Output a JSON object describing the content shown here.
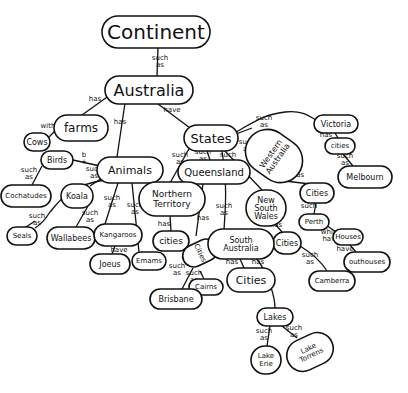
{
  "diagram": {
    "type": "concept-map",
    "style": "hand-drawn",
    "colors": {
      "ink": "#111111",
      "background": "#ffffff"
    },
    "nodes": [
      {
        "id": "continent",
        "label": "Continent",
        "x": 156,
        "y": 32,
        "rx": 54,
        "ry": 16,
        "fs": 20
      },
      {
        "id": "australia",
        "label": "Australia",
        "x": 149,
        "y": 90,
        "rx": 44,
        "ry": 14,
        "fs": 16
      },
      {
        "id": "farms",
        "label": "farms",
        "x": 81,
        "y": 128,
        "rx": 27,
        "ry": 13,
        "fs": 12
      },
      {
        "id": "cows",
        "label": "Cows",
        "x": 37,
        "y": 142,
        "rx": 13,
        "ry": 9,
        "fs": 8
      },
      {
        "id": "birds",
        "label": "Birds",
        "x": 57,
        "y": 160,
        "rx": 16,
        "ry": 9,
        "fs": 8
      },
      {
        "id": "animals",
        "label": "Animals",
        "x": 130,
        "y": 170,
        "rx": 33,
        "ry": 13,
        "fs": 11
      },
      {
        "id": "cockatoos",
        "label": "Cochatudes",
        "x": 26,
        "y": 196,
        "rx": 25,
        "ry": 11,
        "fs": 7
      },
      {
        "id": "koala",
        "label": "Koala",
        "x": 77,
        "y": 196,
        "rx": 16,
        "ry": 12,
        "fs": 8
      },
      {
        "id": "seals",
        "label": "Seals",
        "x": 22,
        "y": 236,
        "rx": 15,
        "ry": 9,
        "fs": 7
      },
      {
        "id": "wallabees",
        "label": "Wallabees",
        "x": 71,
        "y": 238,
        "rx": 24,
        "ry": 11,
        "fs": 8
      },
      {
        "id": "kangaroos",
        "label": "Kangaroos",
        "x": 118,
        "y": 235,
        "rx": 24,
        "ry": 11,
        "fs": 7
      },
      {
        "id": "joeys",
        "label": "Joeus",
        "x": 110,
        "y": 264,
        "rx": 20,
        "ry": 10,
        "fs": 8
      },
      {
        "id": "emus",
        "label": "Emams",
        "x": 149,
        "y": 261,
        "rx": 17,
        "ry": 9,
        "fs": 7
      },
      {
        "id": "states",
        "label": "States",
        "x": 211,
        "y": 138,
        "rx": 27,
        "ry": 13,
        "fs": 13
      },
      {
        "id": "queensland",
        "label": "Queensland",
        "x": 214,
        "y": 172,
        "rx": 36,
        "ry": 12,
        "fs": 10
      },
      {
        "id": "northern-territory",
        "label": "Northern\nTerritory",
        "x": 172,
        "y": 199,
        "rx": 33,
        "ry": 17,
        "fs": 9
      },
      {
        "id": "nt-cities",
        "label": "cities",
        "x": 171,
        "y": 241,
        "rx": 18,
        "ry": 10,
        "fs": 9
      },
      {
        "id": "new-south-wales",
        "label": "New\nSouth\nWales",
        "x": 266,
        "y": 208,
        "rx": 20,
        "ry": 18,
        "fs": 8
      },
      {
        "id": "western-australia",
        "label": "Western\nAustralia",
        "x": 274,
        "y": 156,
        "rx": 22,
        "ry": 30,
        "fs": 8,
        "rotate": -55
      },
      {
        "id": "victoria",
        "label": "Victoria",
        "x": 336,
        "y": 124,
        "rx": 22,
        "ry": 9,
        "fs": 8
      },
      {
        "id": "vic-cities",
        "label": "cities",
        "x": 340,
        "y": 146,
        "rx": 15,
        "ry": 8,
        "fs": 7
      },
      {
        "id": "melbourne",
        "label": "Melbourn",
        "x": 365,
        "y": 177,
        "rx": 27,
        "ry": 11,
        "fs": 8
      },
      {
        "id": "wa-cities",
        "label": "Cities",
        "x": 317,
        "y": 193,
        "rx": 17,
        "ry": 10,
        "fs": 8
      },
      {
        "id": "perth",
        "label": "Perth",
        "x": 314,
        "y": 222,
        "rx": 15,
        "ry": 8,
        "fs": 7
      },
      {
        "id": "houses",
        "label": "Houses",
        "x": 348,
        "y": 237,
        "rx": 15,
        "ry": 8,
        "fs": 7
      },
      {
        "id": "outhouses",
        "label": "outhouses",
        "x": 367,
        "y": 262,
        "rx": 23,
        "ry": 10,
        "fs": 7
      },
      {
        "id": "nsw-cities",
        "label": "Cities",
        "x": 287,
        "y": 243,
        "rx": 14,
        "ry": 11,
        "fs": 8
      },
      {
        "id": "canberra",
        "label": "Camberra",
        "x": 332,
        "y": 281,
        "rx": 23,
        "ry": 10,
        "fs": 7
      },
      {
        "id": "qld-cities",
        "label": "Cities",
        "x": 200,
        "y": 253,
        "rx": 11,
        "ry": 18,
        "fs": 7,
        "rotate": 65
      },
      {
        "id": "south-australia",
        "label": "South\nAustralia",
        "x": 241,
        "y": 244,
        "rx": 33,
        "ry": 15,
        "fs": 8
      },
      {
        "id": "sa-cities",
        "label": "Cities",
        "x": 251,
        "y": 280,
        "rx": 24,
        "ry": 12,
        "fs": 11
      },
      {
        "id": "cairns",
        "label": "Cairns",
        "x": 206,
        "y": 287,
        "rx": 17,
        "ry": 8,
        "fs": 7
      },
      {
        "id": "brisbane",
        "label": "Brisbane",
        "x": 176,
        "y": 299,
        "rx": 26,
        "ry": 10,
        "fs": 8
      },
      {
        "id": "lakes",
        "label": "Lakes",
        "x": 275,
        "y": 317,
        "rx": 18,
        "ry": 9,
        "fs": 8
      },
      {
        "id": "lake-erie",
        "label": "Lake\nErie",
        "x": 266,
        "y": 360,
        "rx": 15,
        "ry": 14,
        "fs": 7
      },
      {
        "id": "lake-torrens",
        "label": "Lake\nTorrens",
        "x": 310,
        "y": 352,
        "rx": 24,
        "ry": 16,
        "fs": 7,
        "rotate": -25
      }
    ],
    "edges": [
      {
        "from": "continent",
        "to": "australia",
        "label": "such as",
        "path": "M158,48 L157,76",
        "lx": 160,
        "ly": 60
      },
      {
        "from": "australia",
        "to": "farms",
        "label": "has",
        "path": "M110,95 L82,115",
        "lx": 95,
        "ly": 101
      },
      {
        "from": "australia",
        "to": "animals",
        "label": "has",
        "path": "M125,103 L117,157",
        "lx": 120,
        "ly": 124
      },
      {
        "from": "australia",
        "to": "states",
        "label": "have",
        "path": "M158,104 L190,128",
        "lx": 172,
        "ly": 112
      },
      {
        "from": "farms",
        "to": "cows",
        "label": "with",
        "path": "M56,130 L49,137",
        "lx": 48,
        "ly": 128
      },
      {
        "from": "animals",
        "to": "birds",
        "label": "b +",
        "path": "M100,166 L73,160",
        "lx": 84,
        "ly": 157
      },
      {
        "from": "animals",
        "to": "koala",
        "label": "such as",
        "path": "M102,178 L90,186",
        "lx": 94,
        "ly": 171
      },
      {
        "from": "animals",
        "to": "cockatoos",
        "label": "",
        "path": "M105,180 C70,185 60,200 50,212 C45,220 40,225 35,228",
        "lx": 0,
        "ly": 0
      },
      {
        "from": "birds",
        "to": "cockatoos",
        "label": "such as",
        "path": "M42,166 L32,185",
        "lx": 29,
        "ly": 172
      },
      {
        "from": "cockatoos",
        "to": "seals",
        "label": "such as",
        "path": "M35,221 L26,227",
        "lx": 37,
        "ly": 218
      },
      {
        "from": "animals",
        "to": "kangaroos",
        "label": "such as",
        "path": "M118,183 L105,224",
        "lx": 112,
        "ly": 200
      },
      {
        "from": "animals",
        "to": "wallabees",
        "label": "such as",
        "path": "M88,206 L76,227",
        "lx": 90,
        "ly": 215
      },
      {
        "from": "animals",
        "to": "emus",
        "label": "such as",
        "path": "M132,183 L139,252",
        "lx": 135,
        "ly": 207
      },
      {
        "from": "kangaroos",
        "to": "joeys",
        "label": "have",
        "path": "M115,246 L112,254",
        "lx": 119,
        "ly": 252
      },
      {
        "from": "states",
        "to": "northern-territory",
        "label": "such as",
        "path": "M190,147 L170,183",
        "lx": 180,
        "ly": 157
      },
      {
        "from": "states",
        "to": "queensland",
        "label": "such as",
        "path": "M207,151 L210,160",
        "lx": 203,
        "ly": 154
      },
      {
        "from": "states",
        "to": "new-south-wales",
        "label": "such as",
        "path": "M224,150 L262,190",
        "lx": 228,
        "ly": 157
      },
      {
        "from": "states",
        "to": "western-australia",
        "label": "such as",
        "path": "M236,134 L252,128",
        "lx": 247,
        "ly": 144
      },
      {
        "from": "states",
        "to": "victoria",
        "label": "such as",
        "path": "M236,132 C250,125 260,115 285,112 C300,110 308,115 316,120",
        "lx": 264,
        "ly": 120
      },
      {
        "from": "northern-territory",
        "to": "nt-cities",
        "label": "has",
        "path": "M170,216 L171,231",
        "lx": 164,
        "ly": 226
      },
      {
        "from": "queensland",
        "to": "qld-cities",
        "label": "has",
        "path": "M203,184 L196,236",
        "lx": 203,
        "ly": 220
      },
      {
        "from": "states",
        "to": "south-australia",
        "label": "such as",
        "path": "M222,151 C228,190 225,210 224,230",
        "lx": 224,
        "ly": 208
      },
      {
        "from": "western-australia",
        "to": "wa-cities",
        "label": "has",
        "path": "M285,181 L310,184",
        "lx": 298,
        "ly": 177
      },
      {
        "from": "victoria",
        "to": "vic-cities",
        "label": "has",
        "path": "M335,133 L338,138",
        "lx": 326,
        "ly": 137
      },
      {
        "from": "vic-cities",
        "to": "melbourne",
        "label": "such as",
        "path": "M343,154 L353,166",
        "lx": 345,
        "ly": 158
      },
      {
        "from": "wa-cities",
        "to": "perth",
        "label": "such",
        "path": "M316,203 L314,214",
        "lx": 309,
        "ly": 208
      },
      {
        "from": "perth",
        "to": "houses",
        "label": "which have",
        "path": "M326,225 L336,232",
        "lx": 331,
        "ly": 234
      },
      {
        "from": "houses",
        "to": "outhouses",
        "label": "have",
        "path": "M350,245 L356,252",
        "lx": 345,
        "ly": 251
      },
      {
        "from": "new-south-wales",
        "to": "nsw-cities",
        "label": "has",
        "path": "M276,225 L282,232",
        "lx": 276,
        "ly": 227
      },
      {
        "from": "nsw-cities",
        "to": "canberra",
        "label": "such as",
        "path": "M300,246 C315,255 322,263 327,271",
        "lx": 310,
        "ly": 257
      },
      {
        "from": "south-australia",
        "to": "sa-cities",
        "label": "has",
        "path": "M240,259 L244,268",
        "lx": 232,
        "ly": 264
      },
      {
        "from": "south-australia",
        "to": "lakes",
        "label": "has",
        "path": "M256,258 C270,275 275,300 275,308",
        "lx": 258,
        "ly": 264
      },
      {
        "from": "qld-cities",
        "to": "brisbane",
        "label": "such as",
        "path": "M193,268 L182,289",
        "lx": 177,
        "ly": 268
      },
      {
        "from": "qld-cities",
        "to": "cairns",
        "label": "such as",
        "path": "M200,271 L204,279",
        "lx": 194,
        "ly": 275
      },
      {
        "from": "lakes",
        "to": "lake-erie",
        "label": "such as",
        "path": "M270,326 L267,346",
        "lx": 264,
        "ly": 333
      },
      {
        "from": "lakes",
        "to": "lake-torrens",
        "label": "such as",
        "path": "M282,326 L297,338",
        "lx": 294,
        "ly": 330
      }
    ]
  }
}
